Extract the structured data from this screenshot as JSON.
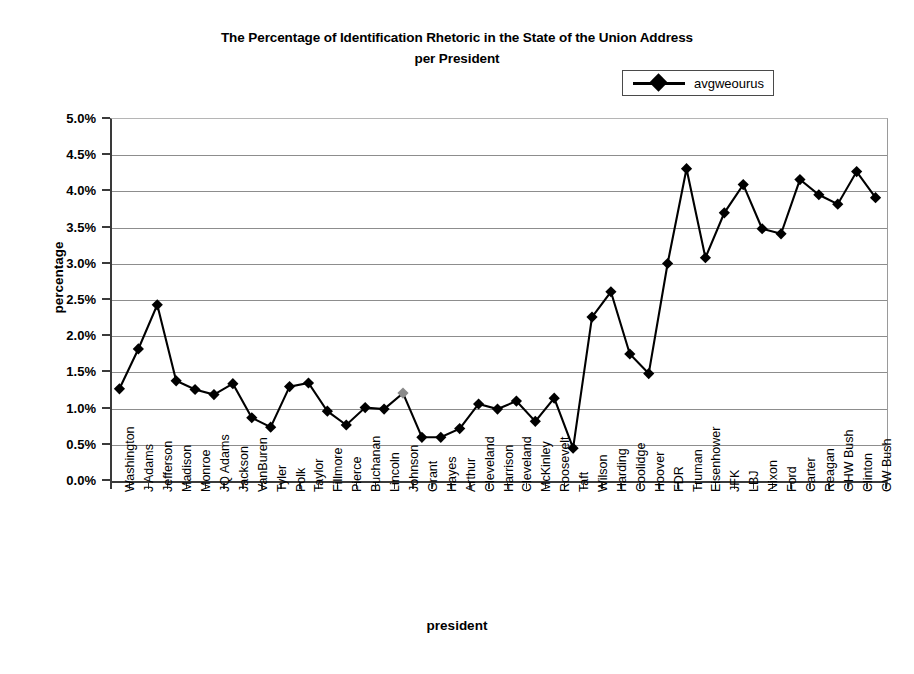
{
  "chart_data": {
    "type": "line",
    "title": "The Percentage of Identification Rhetoric in the State of the Union Address per President",
    "title_line1": "The Percentage of Identification Rhetoric in the State of the Union Address",
    "title_line2": "per President",
    "xlabel": "president",
    "ylabel": "percentage",
    "ylim": [
      0,
      5
    ],
    "ytick_labels": [
      "0.0%",
      "0.5%",
      "1.0%",
      "1.5%",
      "2.0%",
      "2.5%",
      "3.0%",
      "3.5%",
      "4.0%",
      "4.5%",
      "5.0%"
    ],
    "ytick_values": [
      0,
      0.5,
      1.0,
      1.5,
      2.0,
      2.5,
      3.0,
      3.5,
      4.0,
      4.5,
      5.0
    ],
    "grid": true,
    "grid_axis": "y",
    "legend_position": "top-right",
    "legend": [
      "avgweourus"
    ],
    "marker": "diamond",
    "line_color": "#000000",
    "categories": [
      "Washington",
      "J Adams",
      "Jefferson",
      "Madison",
      "Monroe",
      "JQ Adams",
      "Jackson",
      "VanBuren",
      "Tyler",
      "Polk",
      "Taylor",
      "Fillmore",
      "Pierce",
      "Buchanan",
      "Lincoln",
      "Johnson",
      "Grant",
      "Hayes",
      "Arthur",
      "Cleveland",
      "Harrison",
      "Cleveland",
      "McKinley",
      "Roosevelt",
      "Taft",
      "Wilson",
      "Harding",
      "Coolidge",
      "Hoover",
      "FDR",
      "Truman",
      "Eisenhower",
      "JFK",
      "LBJ",
      "Nixon",
      "Ford",
      "Carter",
      "Reagan",
      "GHW Bush",
      "Clinton",
      "GW Bush"
    ],
    "series": [
      {
        "name": "avgweourus",
        "values": [
          1.26,
          1.81,
          2.42,
          1.37,
          1.25,
          1.18,
          1.33,
          0.86,
          0.73,
          1.29,
          1.34,
          0.95,
          0.76,
          1.0,
          0.98,
          1.2,
          0.59,
          0.59,
          0.71,
          1.05,
          0.98,
          1.09,
          0.81,
          1.13,
          0.44,
          2.25,
          2.6,
          1.74,
          1.47,
          2.99,
          4.3,
          3.07,
          3.69,
          4.08,
          3.47,
          3.4,
          4.15,
          3.94,
          3.81,
          4.26,
          3.9
        ]
      }
    ]
  }
}
